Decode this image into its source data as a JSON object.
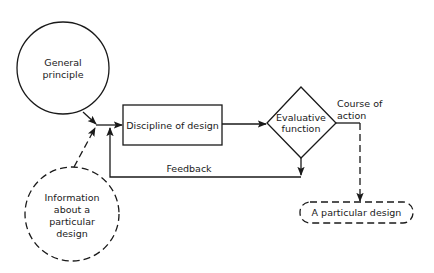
{
  "diagram": {
    "nodes": {
      "general_principle": {
        "shape": "circle",
        "style": "solid",
        "lines": [
          "General",
          "principle"
        ]
      },
      "information": {
        "shape": "circle",
        "style": "dashed",
        "lines": [
          "Information",
          "about a",
          "particular",
          "design"
        ]
      },
      "discipline": {
        "shape": "rectangle",
        "style": "solid",
        "label": "Discipline of design"
      },
      "evaluative": {
        "shape": "diamond",
        "style": "solid",
        "lines": [
          "Evaluative",
          "function"
        ]
      },
      "particular_design": {
        "shape": "rounded-rectangle",
        "style": "dashed",
        "label": "A particular design"
      }
    },
    "edges": [
      {
        "from": "general_principle",
        "to": "discipline",
        "style": "solid"
      },
      {
        "from": "information",
        "to": "discipline",
        "style": "dashed"
      },
      {
        "from": "discipline",
        "to": "evaluative",
        "style": "solid"
      },
      {
        "from": "evaluative",
        "to": "discipline",
        "style": "solid",
        "label": "Feedback"
      },
      {
        "from": "evaluative",
        "to": "particular_design",
        "style": "dashed",
        "label": "Course of action"
      }
    ],
    "edge_labels": {
      "feedback": "Feedback",
      "course_line1": "Course of",
      "course_line2": "action"
    }
  }
}
